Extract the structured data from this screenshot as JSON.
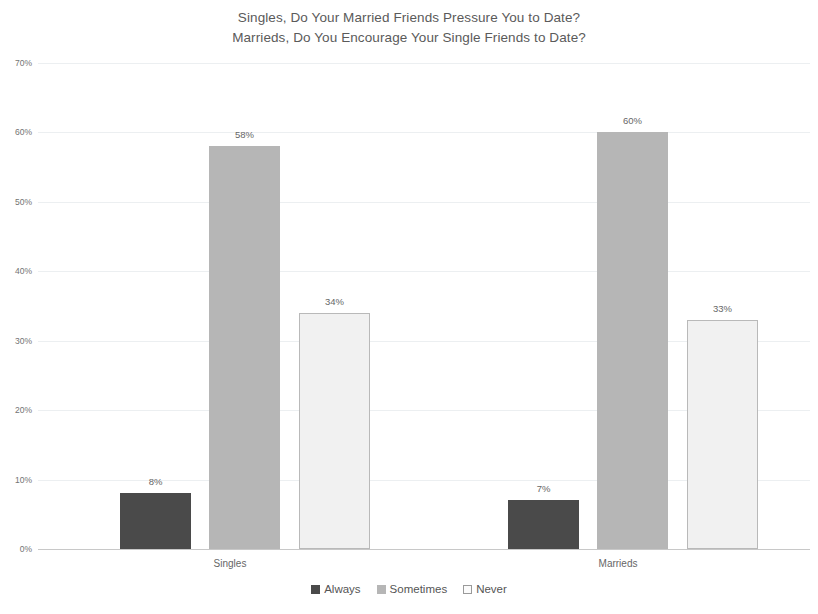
{
  "chart_data": {
    "type": "bar",
    "title": "Singles, Do Your Married Friends Pressure You to Date? Marrieds, Do You Encourage Your Single Friends to Date?",
    "title_lines": [
      "Singles, Do Your Married Friends Pressure You to Date?",
      "Marrieds, Do You Encourage Your Single Friends to Date?"
    ],
    "categories": [
      "Singles",
      "Marrieds"
    ],
    "series": [
      {
        "name": "Always",
        "values": [
          8,
          7
        ],
        "labels": [
          "8%",
          "7%"
        ],
        "color": "#4a4a4a"
      },
      {
        "name": "Sometimes",
        "values": [
          58,
          60
        ],
        "labels": [
          "58%",
          "60%"
        ],
        "color": "#b6b6b6"
      },
      {
        "name": "Never",
        "values": [
          34,
          33
        ],
        "labels": [
          "34%",
          "33%"
        ],
        "color": "#f1f1f1"
      }
    ],
    "xlabel": "",
    "ylabel": "",
    "ylim": [
      0,
      70
    ],
    "ytick_values": [
      70,
      60,
      50,
      40,
      30,
      20,
      10,
      0
    ],
    "ytick_labels": [
      "70%",
      "60%",
      "50%",
      "40%",
      "30%",
      "20%",
      "10%",
      "0%"
    ],
    "grid": true,
    "legend_position": "bottom",
    "value_suffix": "%"
  },
  "axis": {
    "y": {
      "ticks": [
        {
          "value": 70,
          "label": "70%"
        },
        {
          "value": 60,
          "label": "60%"
        },
        {
          "value": 50,
          "label": "50%"
        },
        {
          "value": 40,
          "label": "40%"
        },
        {
          "value": 30,
          "label": "30%"
        },
        {
          "value": 20,
          "label": "20%"
        },
        {
          "value": 10,
          "label": "10%"
        },
        {
          "value": 0,
          "label": "0%"
        }
      ]
    },
    "x": {
      "categories": [
        {
          "label": "Singles"
        },
        {
          "label": "Marrieds"
        }
      ]
    }
  },
  "legend": {
    "items": [
      {
        "label": "Always",
        "swatch": "always-swatch-icon"
      },
      {
        "label": "Sometimes",
        "swatch": "sometimes-swatch-icon"
      },
      {
        "label": "Never",
        "swatch": "never-swatch-icon"
      }
    ]
  },
  "bars": [
    {
      "group": "Singles",
      "series": "Always",
      "value": 8,
      "label": "8%"
    },
    {
      "group": "Singles",
      "series": "Sometimes",
      "value": 58,
      "label": "58%"
    },
    {
      "group": "Singles",
      "series": "Never",
      "value": 34,
      "label": "34%"
    },
    {
      "group": "Marrieds",
      "series": "Always",
      "value": 7,
      "label": "7%"
    },
    {
      "group": "Marrieds",
      "series": "Sometimes",
      "value": 60,
      "label": "60%"
    },
    {
      "group": "Marrieds",
      "series": "Never",
      "value": 33,
      "label": "33%"
    }
  ]
}
